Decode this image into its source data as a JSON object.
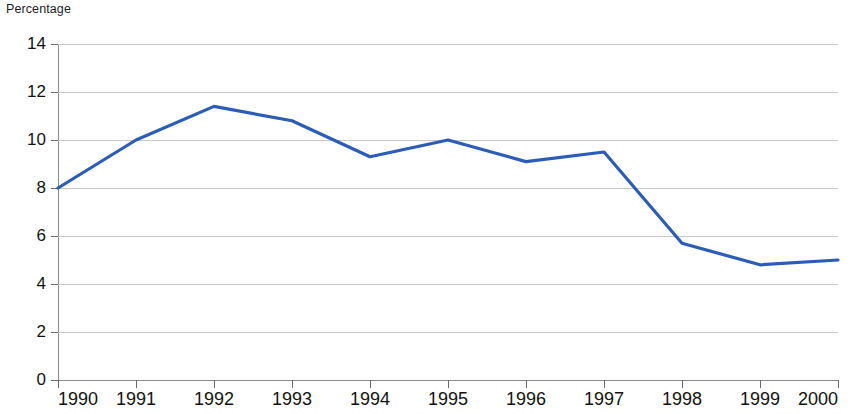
{
  "chart_data": {
    "type": "line",
    "title": "",
    "ylabel": "Percentage",
    "xlabel": "",
    "categories": [
      "1990",
      "1991",
      "1992",
      "1993",
      "1994",
      "1995",
      "1996",
      "1997",
      "1998",
      "1999",
      "2000"
    ],
    "x": [
      1990,
      1991,
      1992,
      1993,
      1994,
      1995,
      1996,
      1997,
      1998,
      1999,
      2000
    ],
    "values": [
      8.0,
      10.0,
      11.4,
      10.8,
      9.3,
      10.0,
      9.1,
      9.5,
      5.7,
      4.8,
      5.0
    ],
    "series": [
      {
        "name": "Percentage",
        "color": "#2a5cb8",
        "values": [
          8.0,
          10.0,
          11.4,
          10.8,
          9.3,
          10.0,
          9.1,
          9.5,
          5.7,
          4.8,
          5.0
        ]
      }
    ],
    "ylim": [
      0,
      14
    ],
    "xlim": [
      1990,
      2000
    ],
    "yticks": [
      0,
      2,
      4,
      6,
      8,
      10,
      12,
      14
    ],
    "ytick_labels": [
      "0",
      "2",
      "4",
      "6",
      "8",
      "10",
      "12",
      "14"
    ],
    "xtick_labels": [
      "1990",
      "1991",
      "1992",
      "1993",
      "1994",
      "1995",
      "1996",
      "1997",
      "1998",
      "1999",
      "2000"
    ],
    "grid": "horizontal",
    "legend": "none",
    "annotations": []
  },
  "colors": {
    "line": "#2a5cb8",
    "gridline": "#c8c8c8",
    "axis": "#8a8a8a",
    "text": "#121212",
    "background": "#ffffff"
  }
}
